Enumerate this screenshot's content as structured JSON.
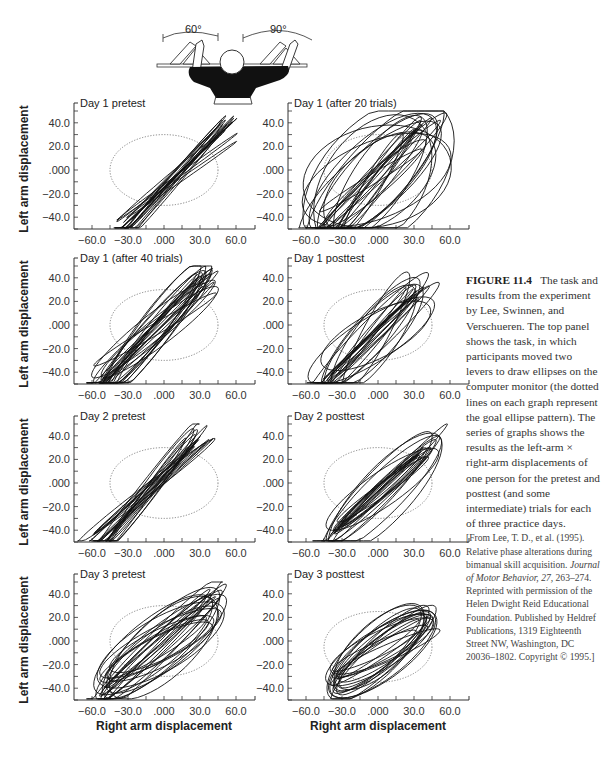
{
  "figure": {
    "label": "FIGURE 11.4",
    "caption_main": "The task and results from the experiment by Lee, Swinnen, and Verschueren. The top panel shows the task, in which participants moved two levers to draw ellipses on the computer monitor (the dotted lines on each graph represent the goal ellipse pattern). The series of graphs shows the results as the left-arm × right-arm displacements of one person for the pretest and posttest (and some intermediate) trials for each of three practice days.",
    "citation_pre": "[From Lee, T. D., et al. (1995). Relative phase alterations during bimanual skill acquisition. ",
    "citation_journal": "Journal of Motor Behavior, 27,",
    "citation_post": " 263–274. Reprinted with permission of the Helen Dwight Reid Educational Foundation. Published by Heldref Publications, 1319 Eighteenth Street NW, Washington, DC 20036–1802. Copyright © 1995.]"
  },
  "illustration": {
    "left_angle": "60°",
    "right_angle": "90°"
  },
  "chart_data": [
    {
      "type": "line",
      "title": "Day 1 pretest",
      "xlabel": "",
      "ylabel": "Left arm displacement",
      "xlim": [
        -75,
        75
      ],
      "ylim": [
        -50,
        50
      ],
      "xticks": [
        "-60.0",
        "-30.0",
        ".000",
        "30.0",
        "60.0"
      ],
      "yticks": [
        "40.0",
        "20.0",
        ".000",
        "-20.0",
        "-40.0"
      ],
      "goal_ellipse": {
        "cx": 0,
        "cy": 0,
        "rx": 45,
        "ry": 30
      },
      "trajectory": {
        "cx": 10,
        "cy": -5,
        "major": 62,
        "minor": 8,
        "angle_deg": -43,
        "loops": 14,
        "spread": 0.35
      }
    },
    {
      "type": "line",
      "title": "Day 1 (after 20 trials)",
      "xlabel": "",
      "ylabel": "",
      "xlim": [
        -75,
        75
      ],
      "ylim": [
        -50,
        50
      ],
      "xticks": [
        "-60.0",
        "-30.0",
        ".000",
        "30.0",
        "60.0"
      ],
      "yticks": [
        "40.0",
        "20.0",
        ".000",
        "-20.0",
        "-40.0"
      ],
      "goal_ellipse": {
        "cx": 0,
        "cy": 0,
        "rx": 45,
        "ry": 30
      },
      "trajectory": {
        "cx": -2,
        "cy": -8,
        "major": 55,
        "minor": 22,
        "angle_deg": -40,
        "loops": 22,
        "spread": 1.4
      }
    },
    {
      "type": "line",
      "title": "Day 1 (after 40 trials)",
      "xlabel": "",
      "ylabel": "Left arm displacement",
      "xlim": [
        -75,
        75
      ],
      "ylim": [
        -50,
        50
      ],
      "xticks": [
        "-60.0",
        "-30.0",
        ".000",
        "30.0",
        "60.0"
      ],
      "yticks": [
        "40.0",
        "20.0",
        ".000",
        "-20.0",
        "-40.0"
      ],
      "goal_ellipse": {
        "cx": 0,
        "cy": 0,
        "rx": 45,
        "ry": 30
      },
      "trajectory": {
        "cx": -8,
        "cy": -5,
        "major": 60,
        "minor": 18,
        "angle_deg": -45,
        "loops": 20,
        "spread": 0.6
      }
    },
    {
      "type": "line",
      "title": "Day 1 posttest",
      "xlabel": "",
      "ylabel": "",
      "xlim": [
        -75,
        75
      ],
      "ylim": [
        -50,
        50
      ],
      "xticks": [
        "-60.0",
        "-30.0",
        ".000",
        "30.0",
        "60.0"
      ],
      "yticks": [
        "40.0",
        "20.0",
        ".000",
        "-20.0",
        "-40.0"
      ],
      "goal_ellipse": {
        "cx": 0,
        "cy": 0,
        "rx": 45,
        "ry": 30
      },
      "trajectory": {
        "cx": -5,
        "cy": -10,
        "major": 50,
        "minor": 22,
        "angle_deg": -42,
        "loops": 18,
        "spread": 0.9
      }
    },
    {
      "type": "line",
      "title": "Day 2 pretest",
      "xlabel": "",
      "ylabel": "Left arm displacement",
      "xlim": [
        -75,
        75
      ],
      "ylim": [
        -50,
        50
      ],
      "xticks": [
        "-60.0",
        "-30.0",
        ".000",
        "30.0",
        "60.0"
      ],
      "yticks": [
        "40.0",
        "20.0",
        ".000",
        "-20.0",
        "-40.0"
      ],
      "goal_ellipse": {
        "cx": 0,
        "cy": 0,
        "rx": 45,
        "ry": 30
      },
      "trajectory": {
        "cx": -12,
        "cy": -5,
        "major": 62,
        "minor": 9,
        "angle_deg": -47,
        "loops": 16,
        "spread": 0.45
      }
    },
    {
      "type": "line",
      "title": "Day 2 posttest",
      "xlabel": "",
      "ylabel": "",
      "xlim": [
        -75,
        75
      ],
      "ylim": [
        -50,
        50
      ],
      "xticks": [
        "-60.0",
        "-30.0",
        ".000",
        "30.0",
        "60.0"
      ],
      "yticks": [
        "40.0",
        "20.0",
        ".000",
        "-20.0",
        "-40.0"
      ],
      "goal_ellipse": {
        "cx": 0,
        "cy": 0,
        "rx": 45,
        "ry": 30
      },
      "trajectory": {
        "cx": 2,
        "cy": -7,
        "major": 45,
        "minor": 32,
        "angle_deg": -35,
        "loops": 18,
        "spread": 0.35
      }
    },
    {
      "type": "line",
      "title": "Day 3 pretest",
      "xlabel": "Right arm displacement",
      "ylabel": "Left arm displacement",
      "xlim": [
        -75,
        75
      ],
      "ylim": [
        -50,
        50
      ],
      "xticks": [
        "-60.0",
        "-30.0",
        ".000",
        "30.0",
        "60.0"
      ],
      "yticks": [
        "40.0",
        "20.0",
        ".000",
        "-20.0",
        "-40.0"
      ],
      "goal_ellipse": {
        "cx": 0,
        "cy": 0,
        "rx": 45,
        "ry": 30
      },
      "trajectory": {
        "cx": -5,
        "cy": -5,
        "major": 52,
        "minor": 30,
        "angle_deg": -30,
        "loops": 20,
        "spread": 0.45
      }
    },
    {
      "type": "line",
      "title": "Day 3 posttest",
      "xlabel": "Right arm displacement",
      "ylabel": "",
      "xlim": [
        -75,
        75
      ],
      "ylim": [
        -50,
        50
      ],
      "xticks": [
        "-60.0",
        "-30.0",
        ".000",
        "30.0",
        "60.0"
      ],
      "yticks": [
        "40.0",
        "20.0",
        ".000",
        "-20.0",
        "-40.0"
      ],
      "goal_ellipse": {
        "cx": 0,
        "cy": -5,
        "rx": 45,
        "ry": 30
      },
      "trajectory": {
        "cx": 2,
        "cy": -8,
        "major": 43,
        "minor": 22,
        "angle_deg": -28,
        "loops": 18,
        "spread": 0.3
      }
    }
  ],
  "layout": {
    "columns_axis_x": [
      74,
      288
    ],
    "rows_xaxis_y": [
      229,
      384,
      542,
      700
    ],
    "px_per_unit_x": 1.2,
    "px_per_unit_y": 1.18
  }
}
